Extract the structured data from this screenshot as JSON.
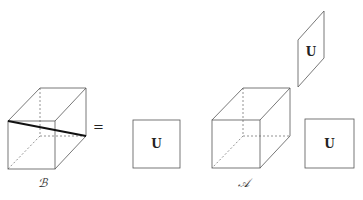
{
  "diagram": {
    "left_cube": {
      "label": "ℬ",
      "front_face": {
        "x1": 8,
        "y1": 121,
        "x2": 55,
        "y2": 169
      },
      "back_face": {
        "x1": 40,
        "y1": 88,
        "x2": 86,
        "y2": 136
      },
      "cut_line": {
        "from": [
          8,
          121
        ],
        "to": [
          86,
          136
        ]
      }
    },
    "equals_sign": "=",
    "middle_square": {
      "label": "U",
      "x1": 133,
      "y1": 120,
      "x2": 180,
      "y2": 168
    },
    "right_cube": {
      "label": "𝒜",
      "front_face": {
        "x1": 212,
        "y1": 120,
        "x2": 260,
        "y2": 168
      },
      "back_face": {
        "x1": 243,
        "y1": 88,
        "x2": 290,
        "y2": 136
      }
    },
    "slanted_face": {
      "label": "U"
    },
    "right_square": {
      "label": "U",
      "x1": 305,
      "y1": 119,
      "x2": 354,
      "y2": 168
    }
  }
}
